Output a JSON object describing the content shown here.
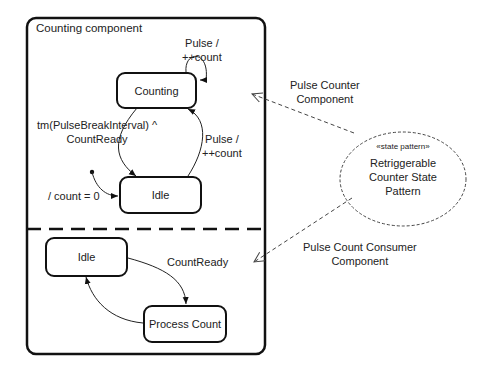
{
  "component": {
    "title": "Counting component"
  },
  "upper_region": {
    "states": [
      {
        "id": "counting",
        "label": "Counting"
      },
      {
        "id": "idle",
        "label": "Idle"
      }
    ],
    "transitions": {
      "self_loop": {
        "line1": "Pulse /",
        "line2": "++count"
      },
      "counting_to_idle": {
        "line1": "tm(PulseBreakInterval) ^",
        "line2": "CountReady"
      },
      "idle_to_counting": {
        "line1": "Pulse /",
        "line2": "++count"
      },
      "initial": {
        "label": "/ count = 0"
      }
    }
  },
  "lower_region": {
    "states": [
      {
        "id": "idle",
        "label": "Idle"
      },
      {
        "id": "process",
        "label": "Process Count"
      }
    ],
    "transitions": {
      "idle_to_process": {
        "label": "CountReady"
      }
    }
  },
  "pattern": {
    "stereotype": "«state pattern»",
    "name_line1": "Retriggerable",
    "name_line2": "Counter State",
    "name_line3": "Pattern"
  },
  "roles": {
    "upper": {
      "line1": "Pulse Counter",
      "line2": "Component"
    },
    "lower": {
      "line1": "Pulse Count Consumer",
      "line2": "Component"
    }
  }
}
